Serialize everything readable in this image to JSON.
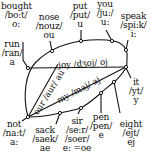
{
  "diagram": {
    "type": "vowel-diagram",
    "words": [
      {
        "id": "bought",
        "word": "bought",
        "ipa": "/bo:t/",
        "vowel": "o:"
      },
      {
        "id": "nose",
        "word": "nose",
        "ipa": "/nouz/",
        "vowel": "ou"
      },
      {
        "id": "put",
        "word": "put",
        "ipa": "/put/",
        "vowel": "u"
      },
      {
        "id": "you",
        "word": "you",
        "ipa": "/ju:/",
        "vowel": "u:"
      },
      {
        "id": "speak",
        "word": "speak",
        "ipa": "/spi:k/",
        "vowel": "i:"
      },
      {
        "id": "run",
        "word": "run",
        "ipa": "/ran/",
        "vowel": "a"
      },
      {
        "id": "it",
        "word": "it",
        "ipa": "/yt/",
        "vowel": "y"
      },
      {
        "id": "not",
        "word": "not",
        "ipa": "/na:t/",
        "vowel": "a:"
      },
      {
        "id": "sack",
        "word": "sack",
        "ipa": "/saek/",
        "vowel": "ae"
      },
      {
        "id": "sir",
        "word": "sir",
        "ipa": "/se:r/ /soer/",
        "vowel": "e: =oe"
      },
      {
        "id": "pen",
        "word": "pen",
        "ipa": "/pen/",
        "vowel": "e"
      },
      {
        "id": "eight",
        "word": "eight",
        "ipa": "/ejt/",
        "vowel": "ej"
      }
    ],
    "diphthongs": [
      {
        "id": "joy",
        "text": "joy /dʒoj/ oj"
      },
      {
        "id": "our",
        "text": "our /aur/ au"
      },
      {
        "id": "my",
        "text": "my /maj/ aj"
      }
    ]
  }
}
